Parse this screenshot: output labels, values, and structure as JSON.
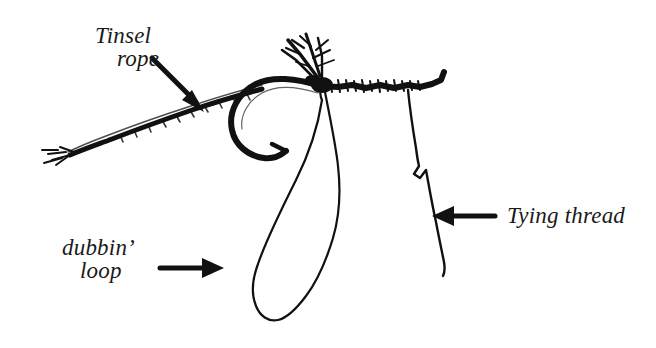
{
  "figure": {
    "background_color": "#ffffff",
    "ink_color": "#111111"
  },
  "labels": [
    {
      "id": "tinsel-rope",
      "line1": "Tinsel",
      "line2": "rope",
      "arrow": "arrow-down-right",
      "points_to": "tinsel rope strand at left of hook"
    },
    {
      "id": "dubbin-loop",
      "line1": "dubbin’",
      "line2": "loop",
      "arrow": "arrow-right",
      "points_to": "hanging thread loop below hook"
    },
    {
      "id": "tying-thread",
      "line1": "Tying thread",
      "line2": "",
      "arrow": "arrow-left",
      "points_to": "thread descending from hook shank"
    }
  ],
  "parts": [
    {
      "name": "hook",
      "description": "curved hook with barbed point and straight shank"
    },
    {
      "name": "tinsel-rope",
      "description": "twisted tapering tinsel strand with frayed tip"
    },
    {
      "name": "dubbing-loop",
      "description": "long narrow teardrop thread loop"
    },
    {
      "name": "tying-thread",
      "description": "thin kinked thread hanging from shank"
    },
    {
      "name": "feather-fibers",
      "description": "splayed fibers above hook eye"
    },
    {
      "name": "thread-wraps",
      "description": "rough wrapped thread along shank"
    }
  ]
}
